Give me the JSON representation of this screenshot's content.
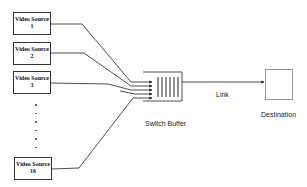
{
  "diagram": {
    "sources": [
      {
        "line1": "Video Source",
        "line2": "1"
      },
      {
        "line1": "Video Source",
        "line2": "2"
      },
      {
        "line1": "Video Source",
        "line2": "3"
      },
      {
        "line1": "Video Source",
        "line2": "16"
      }
    ],
    "ellipsis": "· · · · · ·",
    "buffer_label": "Switch Buffer",
    "link_label": "Link",
    "destination_label": "Destination"
  }
}
